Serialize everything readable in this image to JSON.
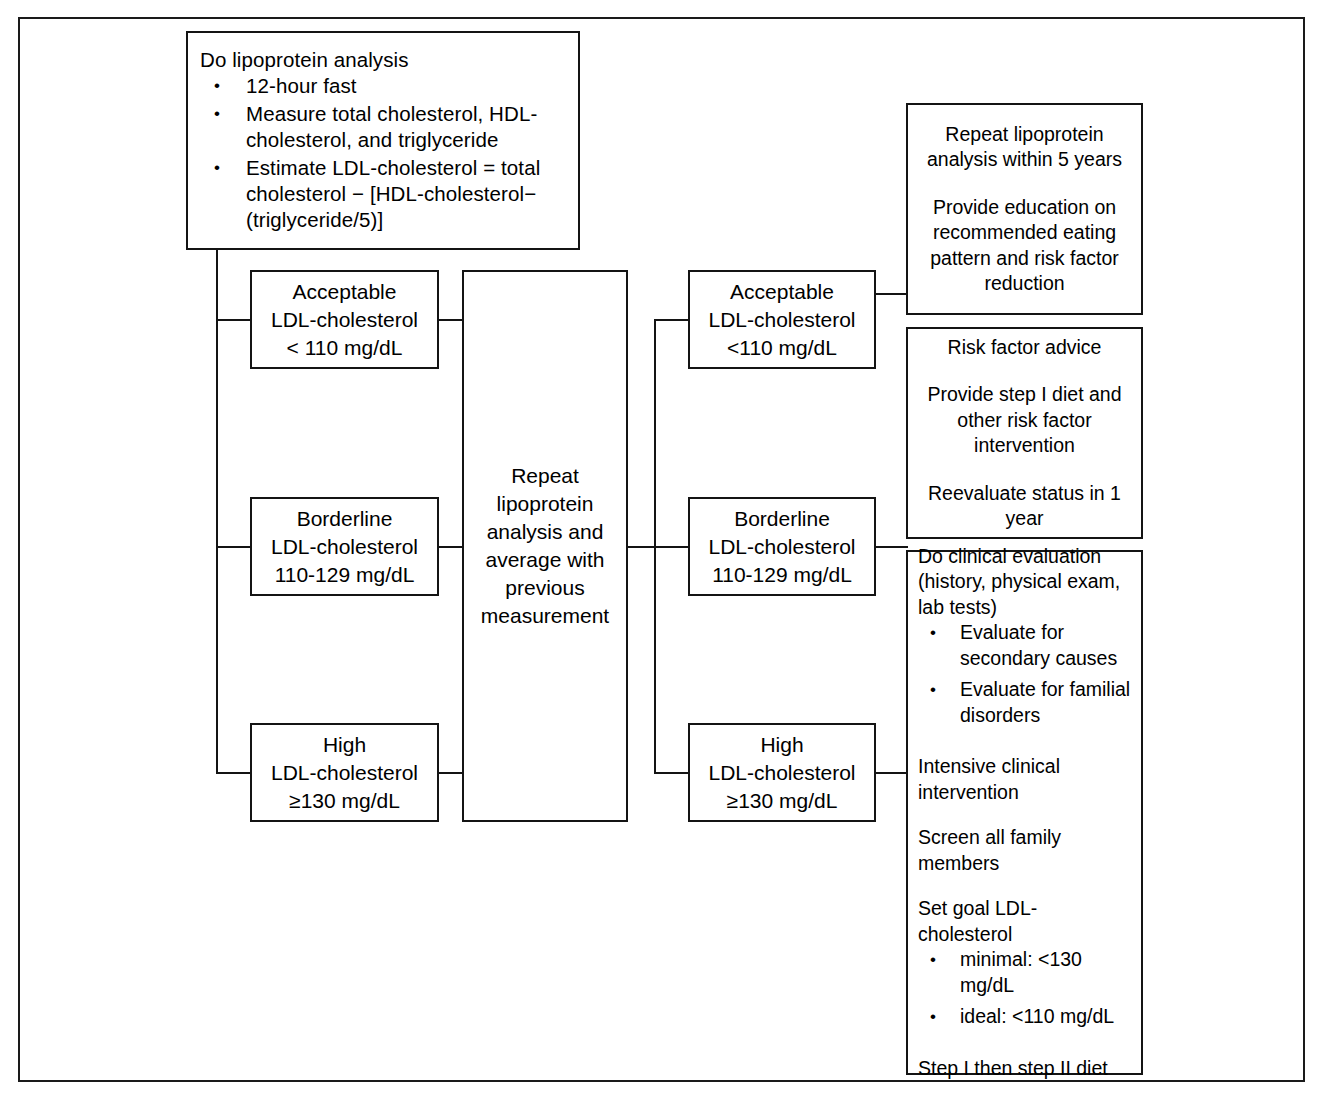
{
  "diagram": {
    "nodes": {
      "start": {
        "heading": "Do lipoprotein analysis",
        "bullets": [
          "12-hour fast",
          "Measure total cholesterol, HDL-cholesterol, and triglyceride",
          "Estimate LDL-cholesterol = total cholesterol − [HDL-cholesterol− (triglyceride/5)]"
        ]
      },
      "initial_acceptable": {
        "line1": "Acceptable",
        "line2": "LDL-cholesterol",
        "line3": "< 110 mg/dL"
      },
      "initial_borderline": {
        "line1": "Borderline",
        "line2": "LDL-cholesterol",
        "line3": "110-129 mg/dL"
      },
      "initial_high": {
        "line1": "High",
        "line2": "LDL-cholesterol",
        "line3": "≥130 mg/dL"
      },
      "repeat_average": {
        "text": "Repeat lipoprotein analysis and average with previous measurement"
      },
      "final_acceptable": {
        "line1": "Acceptable",
        "line2": "LDL-cholesterol",
        "line3": "<110 mg/dL"
      },
      "final_borderline": {
        "line1": "Borderline",
        "line2": "LDL-cholesterol",
        "line3": "110-129 mg/dL"
      },
      "final_high": {
        "line1": "High",
        "line2": "LDL-cholesterol",
        "line3": "≥130 mg/dL"
      },
      "outcome_acceptable": {
        "para1": "Repeat lipoprotein analysis within 5 years",
        "para2": "Provide education on recommended eating pattern and risk factor reduction"
      },
      "outcome_borderline": {
        "para1": "Risk factor advice",
        "para2": "Provide step I diet and other risk factor intervention",
        "para3": "Reevaluate status in 1 year"
      },
      "outcome_high": {
        "para1": "Do clinical evaluation (history, physical exam, lab tests)",
        "bullets1": [
          "Evaluate for secondary causes",
          "Evaluate for familial disorders"
        ],
        "para2": "Intensive clinical intervention",
        "para3": "Screen all family members",
        "para4": "Set goal LDL-cholesterol",
        "bullets2": [
          "minimal: <130 mg/dL",
          "ideal: <110 mg/dL"
        ],
        "para5": "Step I then step II diet"
      }
    },
    "colors": {
      "stroke": "#141414",
      "background": "#ffffff",
      "text": "#000000"
    }
  }
}
